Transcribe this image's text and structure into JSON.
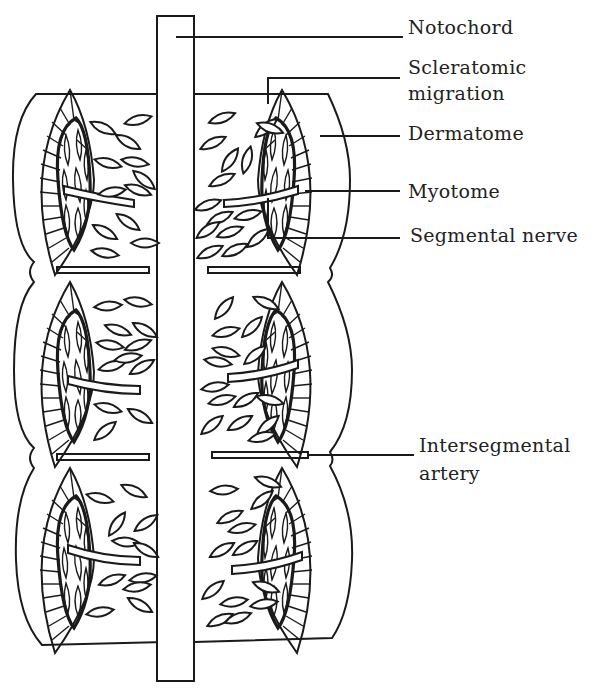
{
  "diagram": {
    "title": "",
    "segment_count": 3,
    "labels": {
      "notochord": "Notochord",
      "scleratomic_line1": "Scleratomic",
      "scleratomic_line2": "migration",
      "dermatome": "Dermatome",
      "myotome": "Myotome",
      "segmental_nerve": "Segmental nerve",
      "intersegmental_line1": "Intersegmental",
      "intersegmental_line2": "artery"
    },
    "colors": {
      "line": "#1a1a1a",
      "background": "#ffffff",
      "text": "#222222"
    }
  }
}
